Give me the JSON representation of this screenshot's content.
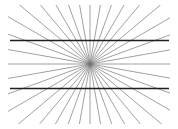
{
  "figure": {
    "canvas": {
      "width": 178,
      "height": 129,
      "background_color": "#ffffff"
    },
    "center_point": {
      "x": 90,
      "y": 64,
      "label": "vanishing-point"
    },
    "radial_lines": {
      "count": 36,
      "color": "#787878",
      "stroke_width": 0.7,
      "start_angle_deg": 0,
      "angle_step_deg": 10,
      "ray_length": 210,
      "clip_box": {
        "x": 8,
        "y": 5,
        "width": 162,
        "height": 119
      }
    },
    "horizontal_lines": {
      "count": 2,
      "color": "#1e1e1e",
      "stroke_width": 1.3,
      "x_start": 10,
      "x_end": 169,
      "y_values": [
        40.5,
        88.5
      ],
      "labels": [
        "upper-horizontal-line",
        "lower-horizontal-line"
      ]
    }
  }
}
